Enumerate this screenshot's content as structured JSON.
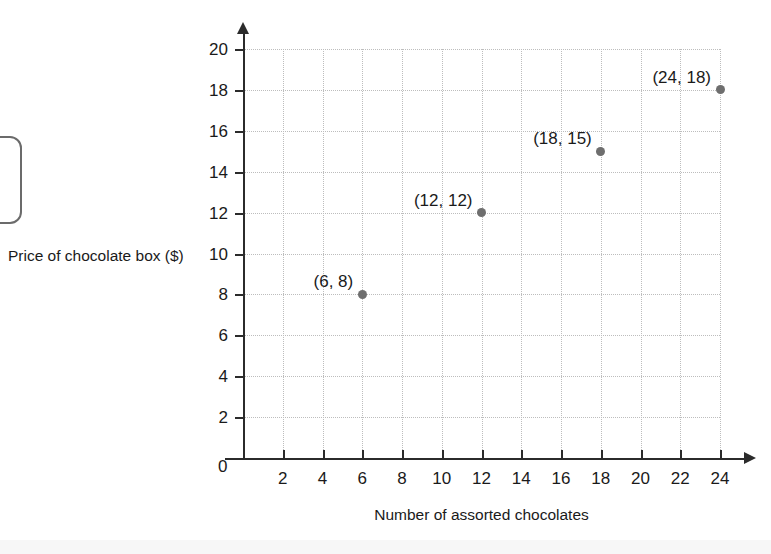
{
  "chart_data": {
    "type": "scatter",
    "title": "",
    "xlabel": "Number of assorted chocolates",
    "ylabel": "Price of chocolate box ($)",
    "xlim": [
      0,
      24
    ],
    "ylim": [
      0,
      20
    ],
    "grid": true,
    "legend": null,
    "origin_label": "0",
    "xticks": [
      2,
      4,
      6,
      8,
      10,
      12,
      14,
      16,
      18,
      20,
      22,
      24
    ],
    "yticks": [
      2,
      4,
      6,
      8,
      10,
      12,
      14,
      16,
      18,
      20
    ],
    "xtick_labels": [
      "2",
      "4",
      "6",
      "8",
      "10",
      "12",
      "14",
      "16",
      "18",
      "20",
      "22",
      "24"
    ],
    "ytick_labels": [
      "2",
      "4",
      "6",
      "8",
      "10",
      "12",
      "14",
      "16",
      "18",
      "20"
    ],
    "point_color": "#6e6e6e",
    "grid_color": "#bdbdbd",
    "axis_color": "#2b2b2b",
    "points": [
      {
        "x": 6,
        "y": 8,
        "label": "(6, 8)"
      },
      {
        "x": 12,
        "y": 12,
        "label": "(12, 12)"
      },
      {
        "x": 18,
        "y": 15,
        "label": "(18, 15)"
      },
      {
        "x": 24,
        "y": 18,
        "label": "(24, 18)"
      }
    ]
  }
}
